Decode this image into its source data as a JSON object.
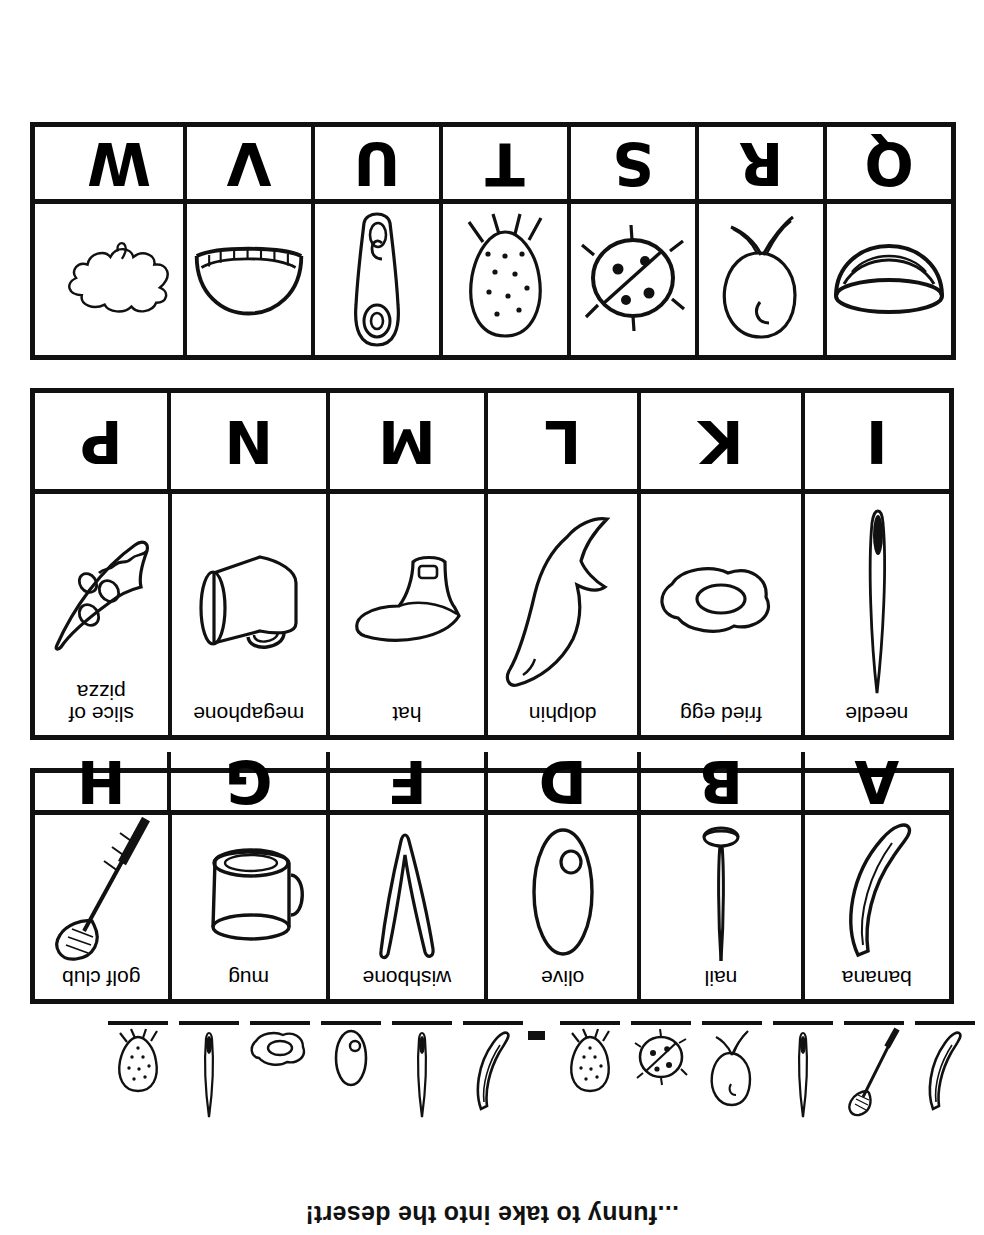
{
  "worksheet": {
    "riddle_prompt": "...funny to take into the desert!",
    "answer_line": {
      "slots": [
        {
          "picture": "banana",
          "blank": "_____"
        },
        {
          "picture": "golf-club",
          "blank": "_____"
        },
        {
          "picture": "needle",
          "blank": "_____"
        },
        {
          "picture": "radish",
          "blank": "_____"
        },
        {
          "picture": "ladybug",
          "blank": "_____"
        },
        {
          "picture": "strawberry",
          "blank": "_____"
        },
        {
          "separator": "-"
        },
        {
          "picture": "banana",
          "blank": "_____"
        },
        {
          "picture": "needle",
          "blank": "_____"
        },
        {
          "picture": "olive",
          "blank": "_____"
        },
        {
          "picture": "fried-egg",
          "blank": "_____"
        },
        {
          "picture": "needle",
          "blank": "_____"
        },
        {
          "picture": "strawberry",
          "blank": "_____"
        }
      ]
    },
    "grids": [
      {
        "id": "grid-1",
        "columns": 6,
        "cells": [
          {
            "letter": "A",
            "label": "banana",
            "icon": "banana-icon"
          },
          {
            "letter": "B",
            "label": "nail",
            "icon": "nail-icon"
          },
          {
            "letter": "D",
            "label": "olive",
            "icon": "olive-icon"
          },
          {
            "letter": "F",
            "label": "wishbone",
            "icon": "wishbone-icon"
          },
          {
            "letter": "G",
            "label": "mug",
            "icon": "mug-icon"
          },
          {
            "letter": "H",
            "label": "golf club",
            "icon": "golf-club-icon"
          }
        ]
      },
      {
        "id": "grid-2",
        "columns": 6,
        "cells": [
          {
            "letter": "I",
            "label": "needle",
            "icon": "needle-icon"
          },
          {
            "letter": "K",
            "label": "fried egg",
            "icon": "fried-egg-icon"
          },
          {
            "letter": "L",
            "label": "dolphin",
            "icon": "dolphin-icon"
          },
          {
            "letter": "M",
            "label": "hat",
            "icon": "hat-icon"
          },
          {
            "letter": "N",
            "label": "megaphone",
            "icon": "megaphone-icon"
          },
          {
            "letter": "P",
            "label": "slice of\npizza",
            "icon": "pizza-slice-icon"
          }
        ]
      },
      {
        "id": "grid-3",
        "columns": 7,
        "cells": [
          {
            "letter": "Q",
            "label": "",
            "icon": "bowl-icon"
          },
          {
            "letter": "R",
            "label": "",
            "icon": "radish-icon"
          },
          {
            "letter": "S",
            "label": "",
            "icon": "ladybug-icon"
          },
          {
            "letter": "T",
            "label": "",
            "icon": "strawberry-icon"
          },
          {
            "letter": "U",
            "label": "",
            "icon": "safety-pin-icon"
          },
          {
            "letter": "V",
            "label": "",
            "icon": "watermelon-icon"
          },
          {
            "letter": "W",
            "label": "",
            "icon": "puddle-icon"
          }
        ]
      }
    ]
  }
}
